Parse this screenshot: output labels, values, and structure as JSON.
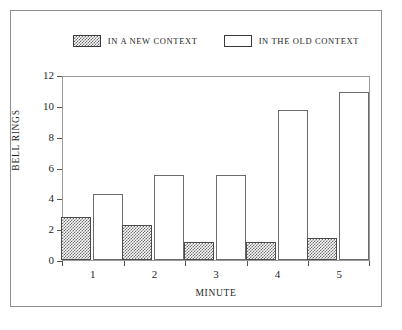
{
  "chart_data": {
    "type": "bar",
    "title": "",
    "subtitle": "",
    "xlabel": "Minute",
    "ylabel": "Bell Rings",
    "categories": [
      "1",
      "2",
      "3",
      "4",
      "5"
    ],
    "series": [
      {
        "name": "In a New Context",
        "values": [
          2.8,
          2.3,
          1.2,
          1.2,
          1.4
        ],
        "fill": "hatched-gray",
        "color": "#6f6f6f"
      },
      {
        "name": "In the Old Context",
        "values": [
          4.3,
          5.5,
          5.5,
          9.7,
          10.9
        ],
        "fill": "open-white",
        "color": "#ffffff"
      }
    ],
    "ylim": [
      0,
      12
    ],
    "yticks": [
      0,
      2,
      4,
      6,
      8,
      10,
      12
    ],
    "ytick_labels": [
      "0",
      "2",
      "4",
      "6",
      "8",
      "10",
      "12"
    ],
    "xtick_labels": [
      "1",
      "2",
      "3",
      "4",
      "5"
    ],
    "grid": false,
    "legend_position": "top-center",
    "frame": "box"
  },
  "legend": {
    "entries": [
      {
        "label": "In a New Context",
        "swatch": "hatched"
      },
      {
        "label": "In the Old Context",
        "swatch": "open"
      }
    ]
  },
  "axes": {
    "y_title": "Bell Rings",
    "x_title": "Minute"
  }
}
